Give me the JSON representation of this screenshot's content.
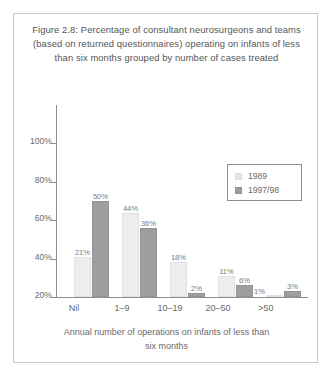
{
  "figure": {
    "title_lines": [
      "Figure 2.8: Percentage of consultant neurosurgeons and teams",
      "(based on returned questionnaires) operating on infants of less",
      "than six months grouped by number of cases treated"
    ],
    "border_color": "#c9c9c9",
    "background": "#ffffff"
  },
  "chart_data": {
    "type": "bar",
    "title": "Figure 2.8: Percentage of consultant neurosurgeons and teams (based on returned questionnaires) operating on infants of less than six months grouped by number of cases treated",
    "categories": [
      "Nil",
      "1–9",
      "10–19",
      "20–50",
      ">50"
    ],
    "series": [
      {
        "name": "1989",
        "color": "#ededed",
        "values": [
          21,
          44,
          18,
          11,
          1
        ],
        "labels": [
          "21%",
          "44%",
          "18%",
          "11%",
          "1%"
        ]
      },
      {
        "name": "1997/98",
        "color": "#9e9e9e",
        "values": [
          50,
          36,
          2,
          6,
          3
        ],
        "labels": [
          "50%",
          "36%",
          "2%",
          "6%",
          "3%"
        ]
      }
    ],
    "xlabel": "Annual number of operations on infants of less than six months",
    "ylabel": "",
    "ylim": [
      0,
      100
    ],
    "yticks": [
      20,
      40,
      60,
      80,
      100
    ],
    "ytick_labels": [
      "20%",
      "40%",
      "60%",
      "80%",
      "100%"
    ],
    "grid": false,
    "legend_position": "top-right"
  },
  "legend": {
    "entries": [
      {
        "label": "1989",
        "color": "#e6e6e6"
      },
      {
        "label": "1997/98",
        "color": "#9e9e9e"
      }
    ]
  },
  "xaxis": {
    "title_lines": [
      "Annual number of operations on infants of less than",
      "six months"
    ]
  }
}
